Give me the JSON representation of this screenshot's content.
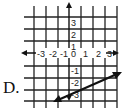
{
  "option_label": "D.",
  "graph": {
    "x_ticks": [
      "-3",
      "-2",
      "-1",
      "0",
      "1",
      "2",
      "3"
    ],
    "y_ticks_pos": [
      "3",
      "2",
      "1"
    ],
    "y_ticks_neg": [
      "-1",
      "-2",
      "-3"
    ],
    "grid_color": "#222222",
    "line_color": "#111111"
  },
  "line": {
    "description": "line with arrows through approx (-1.25,-4.1) and (4.3,-1.6), slope about 1/2",
    "slope": 0.5,
    "y_intercept": -3.5
  }
}
